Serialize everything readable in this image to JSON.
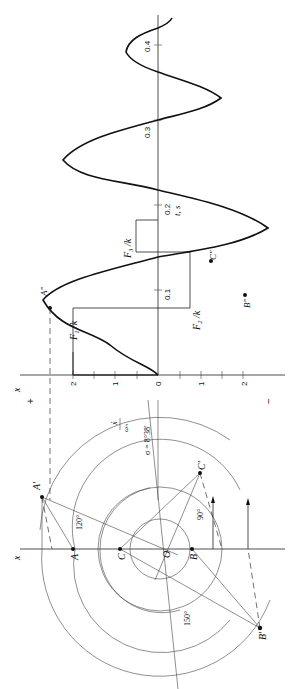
{
  "figure": {
    "orientation": "rotated-90-ccw",
    "time_plot": {
      "x_axis_label": "x",
      "t_axis_label": "t, s",
      "x_ticks": [
        "2",
        "1",
        "0",
        "1",
        "2"
      ],
      "x_signs": {
        "plus": "+",
        "minus": "−"
      },
      "t_ticks": [
        "0",
        "0.1",
        "0.2",
        "0.3",
        "0.4"
      ],
      "force_labels": [
        "F₁ /k",
        "F₂ /k",
        "F₃ /k"
      ],
      "points": [
        "A″",
        "B″",
        "C″"
      ]
    },
    "phase_plane": {
      "x_axis_label": "x",
      "velocity_label_num": "ẋ",
      "velocity_label_den": "ωₙ",
      "sigma_label": "σ = 8°38′",
      "points": [
        "A",
        "A′",
        "B",
        "B′",
        "C",
        "C′",
        "O"
      ],
      "angles": [
        "120°",
        "90°",
        "150°"
      ]
    }
  }
}
